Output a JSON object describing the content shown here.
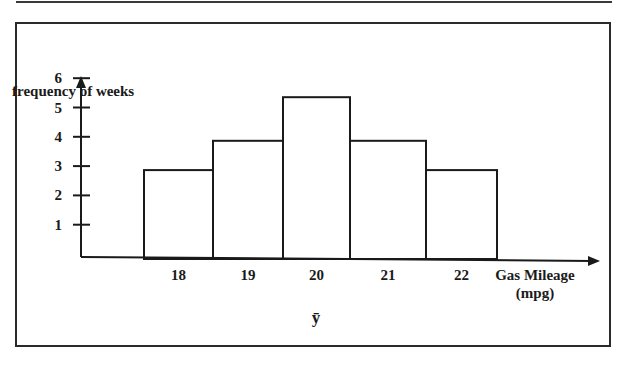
{
  "chart_data": {
    "type": "bar",
    "title": "",
    "xlabel": "Gas Mileage (mpg)",
    "xlabel_lines": [
      "Gas Mileage",
      "(mpg)"
    ],
    "ylabel": "frequency of weeks",
    "categories": [
      "18",
      "19",
      "20",
      "21",
      "22"
    ],
    "values": [
      3,
      4,
      6,
      4,
      3
    ],
    "y_ticks": [
      1,
      2,
      3,
      4,
      5,
      6
    ],
    "ylim": [
      0,
      6
    ],
    "grid": false,
    "legend": null,
    "annotations": [
      {
        "text": "ȳ",
        "meaning": "y-bar (mean)",
        "position": "below category 20"
      }
    ],
    "histogram": true
  },
  "labels": {
    "ylabel": "frequency of weeks",
    "xlabel_line1": "Gas Mileage",
    "xlabel_line2": "(mpg)",
    "mean_symbol": "ȳ"
  },
  "colors": {
    "line": "#1a1a1a",
    "background": "#ffffff"
  }
}
